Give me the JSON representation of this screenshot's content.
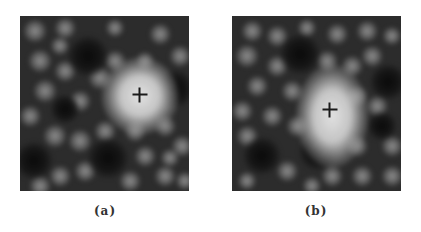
{
  "figure": {
    "panels": [
      {
        "id": "a",
        "caption": "(a)",
        "cross": {
          "x": 120,
          "y": 79
        },
        "bright_spot": {
          "x": 120,
          "y": 80,
          "rx": 30,
          "ry": 30
        },
        "dark_holes": [
          {
            "x": 68,
            "y": 40,
            "r": 17
          },
          {
            "x": 88,
            "y": 142,
            "r": 17
          },
          {
            "x": 155,
            "y": 73,
            "r": 16
          },
          {
            "x": 14,
            "y": 145,
            "r": 16
          },
          {
            "x": 45,
            "y": 93,
            "r": 12
          }
        ],
        "spots": [
          {
            "x": 15,
            "y": 15,
            "r": 10
          },
          {
            "x": 45,
            "y": 12,
            "r": 9
          },
          {
            "x": 95,
            "y": 12,
            "r": 8
          },
          {
            "x": 140,
            "y": 18,
            "r": 9
          },
          {
            "x": 160,
            "y": 40,
            "r": 9
          },
          {
            "x": 20,
            "y": 45,
            "r": 10
          },
          {
            "x": 45,
            "y": 55,
            "r": 9
          },
          {
            "x": 40,
            "y": 30,
            "r": 8
          },
          {
            "x": 95,
            "y": 45,
            "r": 9
          },
          {
            "x": 80,
            "y": 62,
            "r": 10
          },
          {
            "x": 125,
            "y": 45,
            "r": 8
          },
          {
            "x": 25,
            "y": 75,
            "r": 10
          },
          {
            "x": 60,
            "y": 85,
            "r": 9
          },
          {
            "x": 10,
            "y": 100,
            "r": 9
          },
          {
            "x": 35,
            "y": 120,
            "r": 10
          },
          {
            "x": 60,
            "y": 125,
            "r": 10
          },
          {
            "x": 85,
            "y": 115,
            "r": 9
          },
          {
            "x": 115,
            "y": 115,
            "r": 9
          },
          {
            "x": 145,
            "y": 110,
            "r": 9
          },
          {
            "x": 162,
            "y": 130,
            "r": 9
          },
          {
            "x": 125,
            "y": 140,
            "r": 9
          },
          {
            "x": 65,
            "y": 155,
            "r": 9
          },
          {
            "x": 110,
            "y": 165,
            "r": 9
          },
          {
            "x": 20,
            "y": 170,
            "r": 9
          },
          {
            "x": 40,
            "y": 160,
            "r": 9
          },
          {
            "x": 145,
            "y": 160,
            "r": 9
          },
          {
            "x": 165,
            "y": 165,
            "r": 8
          },
          {
            "x": 150,
            "y": 142,
            "r": 8
          }
        ]
      },
      {
        "id": "b",
        "caption": "(b)",
        "cross": {
          "x": 98,
          "y": 94
        },
        "bright_spot": {
          "x": 100,
          "y": 100,
          "rx": 28,
          "ry": 40
        },
        "dark_holes": [
          {
            "x": 68,
            "y": 38,
            "r": 17
          },
          {
            "x": 86,
            "y": 136,
            "r": 16
          },
          {
            "x": 156,
            "y": 66,
            "r": 15
          },
          {
            "x": 30,
            "y": 140,
            "r": 16
          },
          {
            "x": 150,
            "y": 110,
            "r": 12
          }
        ],
        "spots": [
          {
            "x": 20,
            "y": 15,
            "r": 9
          },
          {
            "x": 45,
            "y": 20,
            "r": 9
          },
          {
            "x": 75,
            "y": 12,
            "r": 8
          },
          {
            "x": 105,
            "y": 18,
            "r": 9
          },
          {
            "x": 135,
            "y": 15,
            "r": 9
          },
          {
            "x": 160,
            "y": 20,
            "r": 8
          },
          {
            "x": 15,
            "y": 40,
            "r": 10
          },
          {
            "x": 45,
            "y": 50,
            "r": 9
          },
          {
            "x": 95,
            "y": 45,
            "r": 9
          },
          {
            "x": 120,
            "y": 50,
            "r": 9
          },
          {
            "x": 140,
            "y": 40,
            "r": 9
          },
          {
            "x": 25,
            "y": 70,
            "r": 9
          },
          {
            "x": 60,
            "y": 75,
            "r": 9
          },
          {
            "x": 125,
            "y": 80,
            "r": 9
          },
          {
            "x": 10,
            "y": 95,
            "r": 9
          },
          {
            "x": 40,
            "y": 100,
            "r": 9
          },
          {
            "x": 65,
            "y": 110,
            "r": 9
          },
          {
            "x": 145,
            "y": 90,
            "r": 9
          },
          {
            "x": 160,
            "y": 130,
            "r": 9
          },
          {
            "x": 125,
            "y": 130,
            "r": 9
          },
          {
            "x": 15,
            "y": 120,
            "r": 9
          },
          {
            "x": 55,
            "y": 155,
            "r": 9
          },
          {
            "x": 100,
            "y": 160,
            "r": 9
          },
          {
            "x": 130,
            "y": 160,
            "r": 9
          },
          {
            "x": 160,
            "y": 160,
            "r": 9
          },
          {
            "x": 15,
            "y": 165,
            "r": 8
          },
          {
            "x": 80,
            "y": 170,
            "r": 8
          }
        ]
      }
    ]
  }
}
